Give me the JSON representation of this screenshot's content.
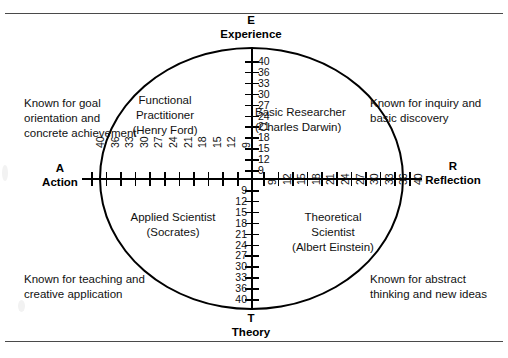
{
  "diagram": {
    "title_axes": {
      "top": {
        "letter": "E",
        "word": "Experience"
      },
      "bottom": {
        "letter": "T",
        "word": "Theory"
      },
      "left": {
        "letter": "A",
        "word": "Action"
      },
      "right": {
        "letter": "R",
        "word": "Reflection"
      }
    },
    "roles": [
      {
        "id": "functional-practitioner",
        "line1": "Functional",
        "line2": "Practitioner",
        "line3": "(Henry Ford)"
      },
      {
        "id": "basic-researcher",
        "line1": "Basic Researcher",
        "line2": "(Charles Darwin)",
        "line3": ""
      },
      {
        "id": "applied-scientist",
        "line1": "Applied Scientist",
        "line2": "(Socrates)",
        "line3": ""
      },
      {
        "id": "theoretical-scientist",
        "line1": "Theoretical",
        "line2": "Scientist",
        "line3": "(Albert Einstein)"
      }
    ],
    "descriptions": {
      "top_left": "Known for goal orientation and concrete achievement",
      "top_right": "Known for inquiry and basic discovery",
      "bottom_left": "Known for teaching and creative application",
      "bottom_right": "Known for abstract thinking and new ideas"
    },
    "scales": {
      "experience_axis_labels": [
        "40",
        "36",
        "33",
        "30",
        "27",
        "24",
        "21",
        "18",
        "15",
        "12",
        "9"
      ],
      "theory_axis_labels": [
        "9",
        "12",
        "15",
        "18",
        "21",
        "24",
        "27",
        "30",
        "33",
        "36",
        "40"
      ],
      "action_axis_labels": [
        "40",
        "36",
        "33",
        "30",
        "27",
        "24",
        "21",
        "18",
        "15",
        "12",
        "9"
      ],
      "reflection_axis_labels": [
        "9",
        "12",
        "15",
        "18",
        "21",
        "24",
        "27",
        "30",
        "33",
        "36",
        "40"
      ]
    },
    "colors": {
      "line": "#000000",
      "rule": "#4a4a4a",
      "text": "#111111",
      "background": "#ffffff"
    }
  },
  "chart_data": {
    "type": "scatter",
    "xlabel": "Action ↔ Reflection",
    "ylabel": "Experience ↔ Theory",
    "x_ticks_left": [
      "40",
      "36",
      "33",
      "30",
      "27",
      "24",
      "21",
      "18",
      "15",
      "12",
      "9"
    ],
    "x_ticks_right": [
      "9",
      "12",
      "15",
      "18",
      "21",
      "24",
      "27",
      "30",
      "33",
      "36",
      "40"
    ],
    "y_ticks_top": [
      "40",
      "36",
      "33",
      "30",
      "27",
      "24",
      "21",
      "18",
      "15",
      "12",
      "9"
    ],
    "y_ticks_bottom": [
      "9",
      "12",
      "15",
      "18",
      "21",
      "24",
      "27",
      "30",
      "33",
      "36",
      "40"
    ],
    "quadrants": [
      {
        "name": "Functional Practitioner (Henry Ford)",
        "position": "upper-left"
      },
      {
        "name": "Basic Researcher (Charles Darwin)",
        "position": "upper-right"
      },
      {
        "name": "Applied Scientist (Socrates)",
        "position": "lower-left"
      },
      {
        "name": "Theoretical Scientist (Albert Einstein)",
        "position": "lower-right"
      }
    ],
    "grid": false,
    "legend": "none"
  }
}
